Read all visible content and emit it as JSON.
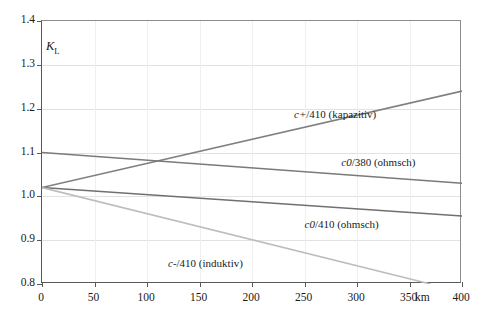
{
  "chart_data": {
    "type": "line",
    "title": "",
    "xlabel": "km",
    "ylabel": "K_L",
    "xlim": [
      0,
      400
    ],
    "ylim": [
      0.8,
      1.4
    ],
    "grid": true,
    "legend_position": "inline-annotations",
    "x_ticks": [
      "0",
      "50",
      "100",
      "150",
      "200",
      "250",
      "300",
      "350",
      "400"
    ],
    "x_tick_values": [
      0,
      50,
      100,
      150,
      200,
      250,
      300,
      350,
      400
    ],
    "y_ticks": [
      "0.8",
      "0.9",
      "1.0",
      "1.1",
      "1.2",
      "1.3",
      "1.4"
    ],
    "y_tick_values": [
      0.8,
      0.9,
      1.0,
      1.1,
      1.2,
      1.3,
      1.4
    ],
    "x_unit_label": "km",
    "series": [
      {
        "name": "c+/410 (kapazitiv)",
        "symbol": "c+",
        "suffix": "/410 (kapazitiv)",
        "color": "#808080",
        "x": [
          0,
          400
        ],
        "values": [
          1.02,
          1.24
        ],
        "label_x": 240,
        "label_y": 1.185
      },
      {
        "name": "c0/380 (ohmsch)",
        "symbol": "c0",
        "suffix": "/380 (ohmsch)",
        "color": "#7a7a7a",
        "x": [
          0,
          400
        ],
        "values": [
          1.1,
          1.03
        ],
        "label_x": 285,
        "label_y": 1.075
      },
      {
        "name": "c0/410 (ohmsch)",
        "symbol": "c0",
        "suffix": "/410 (ohmsch)",
        "color": "#707070",
        "x": [
          0,
          400
        ],
        "values": [
          1.02,
          0.955
        ],
        "label_x": 250,
        "label_y": 0.935
      },
      {
        "name": "c-/410 (induktiv)",
        "symbol": "c-",
        "suffix": "/410 (induktiv)",
        "color": "#bdbdbd",
        "x": [
          0,
          370
        ],
        "values": [
          1.02,
          0.8
        ],
        "label_x": 120,
        "label_y": 0.845
      }
    ]
  },
  "axis": {
    "y_title_main": "K",
    "y_title_sub": "L"
  },
  "colors": {
    "axis": "#595959",
    "frame": "#8c8c8c",
    "grid": "#e2e2e2",
    "text": "#1a1a1a",
    "background": "#ffffff"
  }
}
